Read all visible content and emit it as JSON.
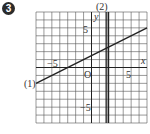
{
  "problem": {
    "number": "3"
  },
  "chart_data": {
    "type": "line",
    "title": "",
    "xlabel": "x",
    "ylabel": "y",
    "xlim": [
      -7,
      7
    ],
    "ylim": [
      -7,
      7
    ],
    "grid": true,
    "origin_label": "O",
    "tick_labels": {
      "x": [
        "-5",
        "5"
      ],
      "y": [
        "5",
        "-5"
      ]
    },
    "series": [
      {
        "name": "(1)",
        "equation": "y = 1/2 x + 3/2",
        "points": [
          [
            -7,
            -2
          ],
          [
            7,
            5
          ]
        ]
      },
      {
        "name": "(2)",
        "equation": "x = 2",
        "points": [
          [
            2,
            -7
          ],
          [
            2,
            7
          ]
        ]
      }
    ]
  },
  "labels": {
    "x_axis": "x",
    "y_axis": "y",
    "origin": "O",
    "x_neg5": "−5",
    "x_pos5": "5",
    "y_pos5": "5",
    "y_neg5": "−5",
    "line1": "(1)",
    "line2": "(2)"
  }
}
